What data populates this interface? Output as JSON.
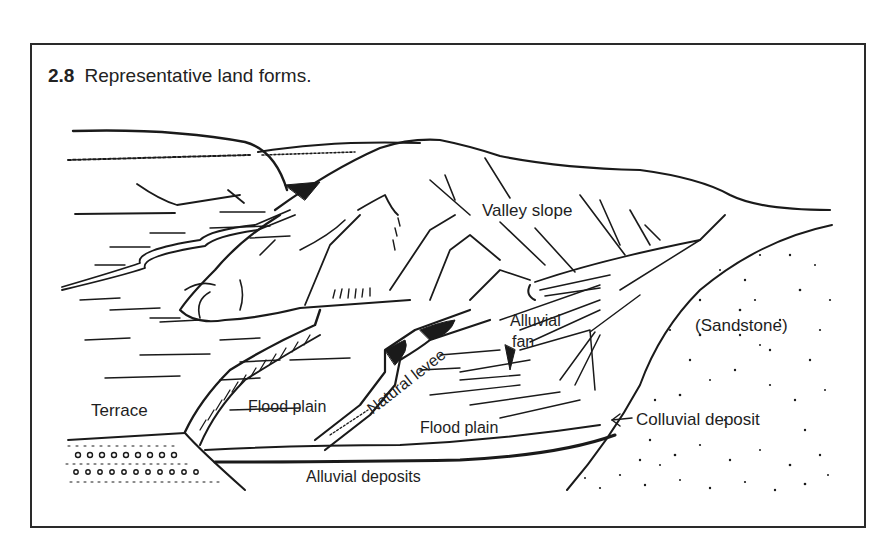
{
  "figure": {
    "number": "2.8",
    "caption": "Representative land forms."
  },
  "labels": {
    "valley_slope": "Valley slope",
    "alluvial": "Alluvial",
    "fan": "fan",
    "sandstone": "(Sandstone)",
    "terrace": "Terrace",
    "flood_plain_left": "Flood plain",
    "natural_levee": "Natural levee",
    "flood_plain_right": "Flood plain",
    "colluvial_deposit": "Colluvial deposit",
    "alluvial_deposits": "Alluvial deposits"
  },
  "colors": {
    "ink": "#1a1a1a",
    "paper": "#ffffff",
    "frame": "#2a2a2a"
  }
}
